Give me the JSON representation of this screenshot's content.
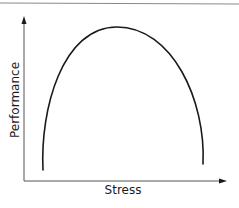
{
  "diagram": {
    "type": "inverted-u-curve",
    "x_axis_label": "Stress",
    "y_axis_label": "Performance",
    "colors": {
      "curve": "#1a1a1a",
      "axes": "#555555",
      "border": "#888888",
      "background": "#ffffff"
    },
    "curve_points": {
      "start": [
        43,
        170
      ],
      "peak": [
        117,
        27
      ],
      "end": [
        203,
        164
      ]
    }
  }
}
